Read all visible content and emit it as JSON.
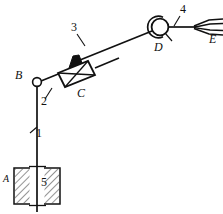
{
  "figure": {
    "type": "mechanical-linkage-schematic",
    "background_color": "#ffffff",
    "line_color": "#111111",
    "fill_black": "#101010",
    "hatch_color": "#444444",
    "width": 223,
    "height": 214
  },
  "joint_labels": {
    "a": "A",
    "b": "B",
    "c": "C",
    "d": "D",
    "e": "E"
  },
  "link_numbers": {
    "one": "1",
    "two": "2",
    "three": "3",
    "four": "4",
    "five": "5"
  },
  "parts": [
    {
      "id": "1",
      "name": "vertical-column-link-1",
      "label": "1"
    },
    {
      "id": "2",
      "name": "lower-arm-link-2",
      "label": "2"
    },
    {
      "id": "3",
      "name": "upper-arm-link-3",
      "label": "3"
    },
    {
      "id": "4",
      "name": "end-rod-link-4",
      "label": "4"
    },
    {
      "id": "5",
      "name": "fixed-guide-support-5",
      "label": "5"
    }
  ],
  "joints": [
    {
      "id": "A",
      "name": "fixed-base-joint-a",
      "label": "A",
      "kind": "fixed-guide"
    },
    {
      "id": "B",
      "name": "pin-joint-b",
      "label": "B",
      "kind": "revolute-pin"
    },
    {
      "id": "C",
      "name": "actuator-block-c",
      "label": "C",
      "kind": "crossed-box-actuator"
    },
    {
      "id": "D",
      "name": "pivot-joint-d",
      "label": "D",
      "kind": "circular-pivot"
    },
    {
      "id": "E",
      "name": "fork-end-e",
      "label": "E",
      "kind": "forked-end-effector"
    }
  ],
  "geometry": {
    "column_x": 37,
    "column_top_y": 84,
    "column_bottom_y": 212,
    "joint_b": {
      "x": 37,
      "y": 82,
      "r": 4.4
    },
    "joint_d": {
      "x": 160,
      "y": 27,
      "r": 9.5
    },
    "box_c": {
      "cx": 75,
      "cy": 68
    },
    "fork_e": {
      "x": 196,
      "y": 27
    }
  }
}
